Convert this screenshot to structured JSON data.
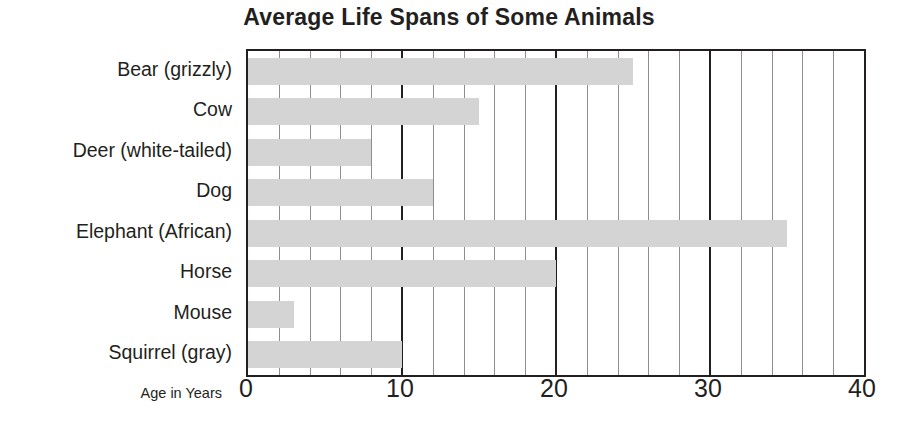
{
  "chart_data": {
    "type": "bar",
    "orientation": "horizontal",
    "title": "Average Life Spans of Some Animals",
    "xlabel": "Age in Years",
    "ylabel": "",
    "categories": [
      "Bear (grizzly)",
      "Cow",
      "Deer (white-tailed)",
      "Dog",
      "Elephant (African)",
      "Horse",
      "Mouse",
      "Squirrel (gray)"
    ],
    "values": [
      25,
      15,
      8,
      12,
      35,
      20,
      3,
      10
    ],
    "xlim": [
      0,
      40
    ],
    "xticks": [
      0,
      10,
      20,
      30,
      40
    ],
    "xtick_labels": [
      "0",
      "10",
      "20",
      "30",
      "40"
    ],
    "minor_tick_interval": 2,
    "grid": true,
    "legend": false,
    "bar_color": "#d4d4d4",
    "axis_color": "#231f20",
    "gridline_color": "#8d8d8d",
    "background": "#ffffff"
  }
}
